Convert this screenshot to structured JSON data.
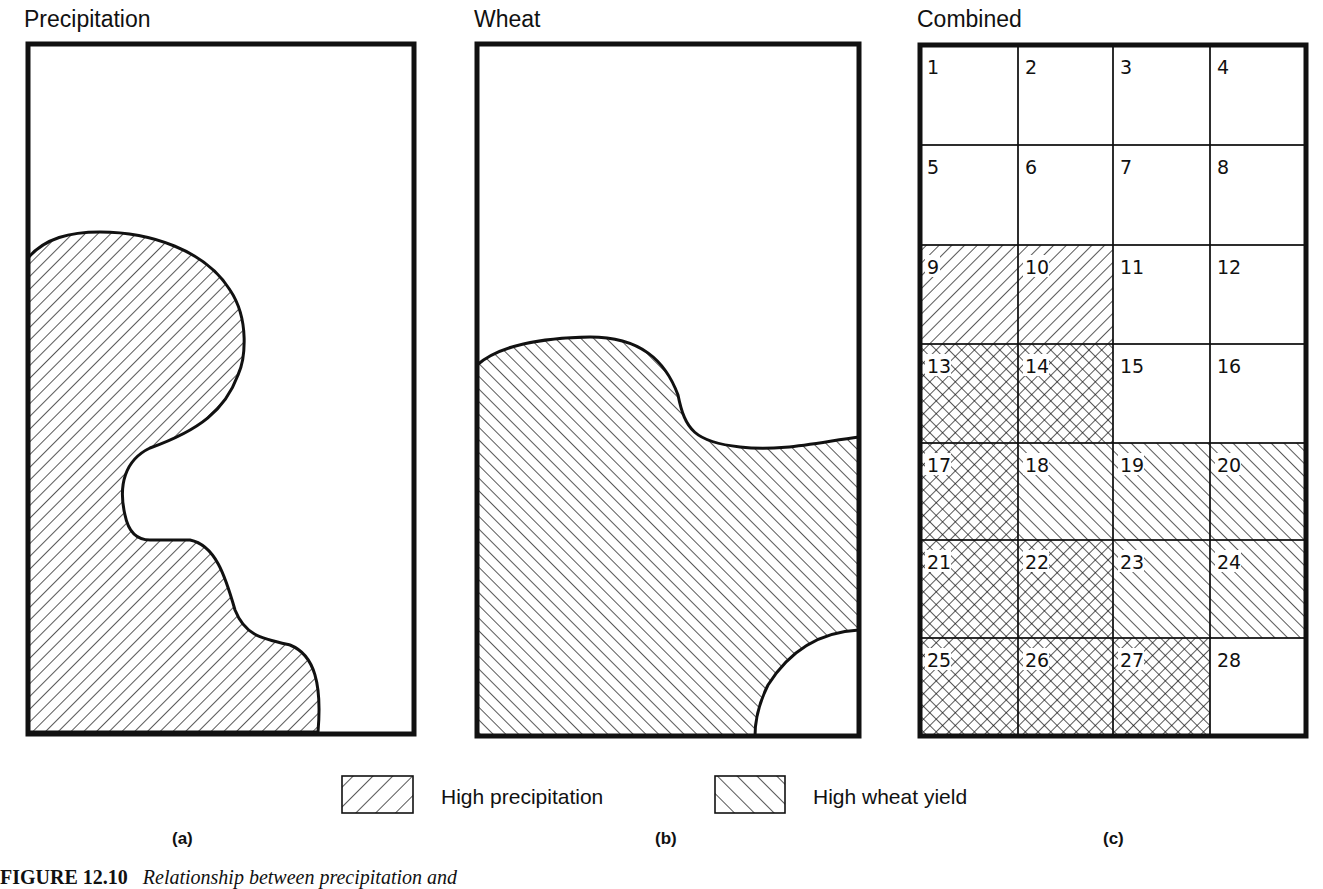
{
  "panels": [
    {
      "id": "a",
      "title": "Precipitation",
      "sub_label": "(a)",
      "pattern": "high-precipitation"
    },
    {
      "id": "b",
      "title": "Wheat",
      "sub_label": "(b)",
      "pattern": "high-wheat-yield"
    },
    {
      "id": "c",
      "title": "Combined",
      "sub_label": "(c)",
      "pattern": "grid-overlay"
    }
  ],
  "legend": {
    "items": [
      {
        "label": "High precipitation",
        "pattern": "back-diagonal-hatch"
      },
      {
        "label": "High wheat yield",
        "pattern": "forward-diagonal-hatch"
      }
    ]
  },
  "grid": {
    "rows": 7,
    "cols": 4,
    "cells": [
      {
        "n": "1",
        "class": "none"
      },
      {
        "n": "2",
        "class": "none"
      },
      {
        "n": "3",
        "class": "none"
      },
      {
        "n": "4",
        "class": "none"
      },
      {
        "n": "5",
        "class": "none"
      },
      {
        "n": "6",
        "class": "none"
      },
      {
        "n": "7",
        "class": "none"
      },
      {
        "n": "8",
        "class": "none"
      },
      {
        "n": "9",
        "class": "precip"
      },
      {
        "n": "10",
        "class": "precip"
      },
      {
        "n": "11",
        "class": "none"
      },
      {
        "n": "12",
        "class": "none"
      },
      {
        "n": "13",
        "class": "both"
      },
      {
        "n": "14",
        "class": "both"
      },
      {
        "n": "15",
        "class": "none"
      },
      {
        "n": "16",
        "class": "none"
      },
      {
        "n": "17",
        "class": "both"
      },
      {
        "n": "18",
        "class": "wheat"
      },
      {
        "n": "19",
        "class": "wheat"
      },
      {
        "n": "20",
        "class": "wheat"
      },
      {
        "n": "21",
        "class": "both"
      },
      {
        "n": "22",
        "class": "both"
      },
      {
        "n": "23",
        "class": "wheat"
      },
      {
        "n": "24",
        "class": "wheat"
      },
      {
        "n": "25",
        "class": "both"
      },
      {
        "n": "26",
        "class": "both"
      },
      {
        "n": "27",
        "class": "both"
      },
      {
        "n": "28",
        "class": "none"
      }
    ]
  },
  "caption": {
    "figure_number": "FIGURE 12.10",
    "text": "Relationship between precipitation and"
  },
  "colors": {
    "ink": "#111111",
    "paper": "#ffffff"
  }
}
